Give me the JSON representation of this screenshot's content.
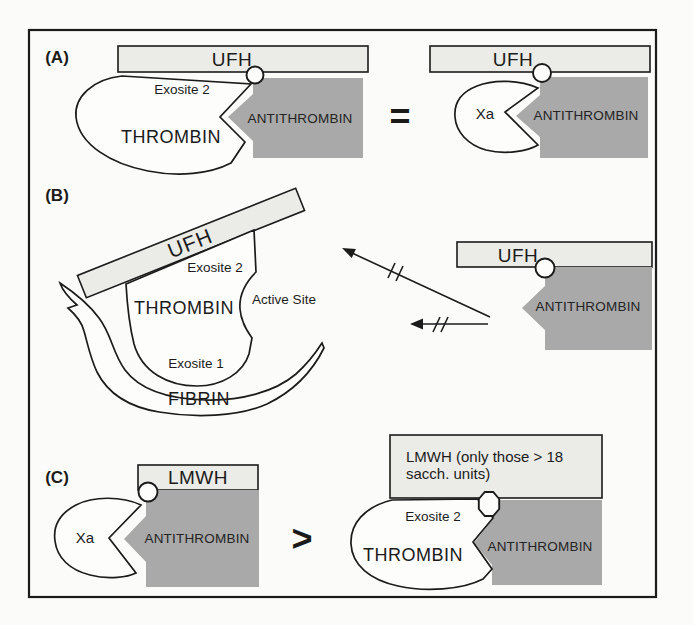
{
  "colors": {
    "bar": "#ebebe7",
    "gray": "#a9a9a9"
  },
  "a": {
    "label": "(A)",
    "ufh_left": "UFH",
    "exosite2": "Exosite 2",
    "thrombin": "THROMBIN",
    "antithrombin_left": "ANTITHROMBIN",
    "equals": "=",
    "ufh_right": "UFH",
    "xa": "Xa",
    "antithrombin_right": "ANTITHROMBIN"
  },
  "b": {
    "label": "(B)",
    "ufh": "UFH",
    "exosite2": "Exosite 2",
    "active_site": "Active Site",
    "thrombin": "THROMBIN",
    "exosite1": "Exosite 1",
    "fibrin": "FIBRIN",
    "ufh_right": "UFH",
    "antithrombin": "ANTITHROMBIN"
  },
  "c": {
    "label": "(C)",
    "lmwh": "LMWH",
    "xa": "Xa",
    "antithrombin_left": "ANTITHROMBIN",
    "greater": ">",
    "lmwh_long_1": "LMWH (only those > 18",
    "lmwh_long_2": "sacch. units)",
    "exosite2": "Exosite 2",
    "thrombin": "THROMBIN",
    "antithrombin_right": "ANTITHROMBIN"
  }
}
